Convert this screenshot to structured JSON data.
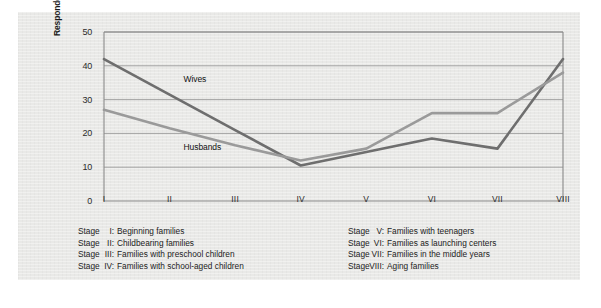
{
  "figure": {
    "background_color": "#e9e9e7",
    "axis_color": "#8a8a8a",
    "grid_color": "#9a9a9a"
  },
  "chart_data": {
    "type": "line",
    "title": "",
    "subtitle": "",
    "xlabel": "",
    "ylabel": "Respondents indicating marriage going well (%)",
    "categories": [
      "I",
      "II",
      "III",
      "IV",
      "V",
      "VI",
      "VII",
      "VIII"
    ],
    "ylim": [
      0,
      50
    ],
    "yticks": [
      0,
      10,
      20,
      30,
      40,
      50
    ],
    "ytick_labels": [
      "0",
      "10",
      "20",
      "30",
      "40",
      "50"
    ],
    "grid": "horizontal",
    "legend_position": "inline-annotations",
    "series": [
      {
        "name": "Wives",
        "color": "#6e6e6e",
        "values": [
          42,
          31.5,
          21,
          10.5,
          14.5,
          18.5,
          15.5,
          42
        ]
      },
      {
        "name": "Husbands",
        "color": "#9a9a9a",
        "values": [
          27,
          21.5,
          16.5,
          12,
          15.5,
          26,
          26,
          38
        ]
      }
    ],
    "annotations": [
      {
        "text": "Wives",
        "x_category": "II",
        "y_value": 36
      },
      {
        "text": "Husbands",
        "x_category": "II",
        "y_value": 16
      }
    ]
  },
  "caption": {
    "left_column": [
      {
        "stage": "Stage",
        "numeral": "I:",
        "description": "Beginning families"
      },
      {
        "stage": "Stage",
        "numeral": "II:",
        "description": "Childbearing families"
      },
      {
        "stage": "Stage",
        "numeral": "III:",
        "description": "Families with preschool children"
      },
      {
        "stage": "Stage",
        "numeral": "IV:",
        "description": "Families with school-aged children"
      }
    ],
    "right_column": [
      {
        "stage": "Stage",
        "numeral": "V:",
        "description": "Families with teenagers"
      },
      {
        "stage": "Stage",
        "numeral": "VI:",
        "description": "Families as launching centers"
      },
      {
        "stage": "Stage",
        "numeral": "VII:",
        "description": "Families in the middle years"
      },
      {
        "stage": "Stage",
        "numeral": "VIII:",
        "description": "Aging families"
      }
    ]
  }
}
